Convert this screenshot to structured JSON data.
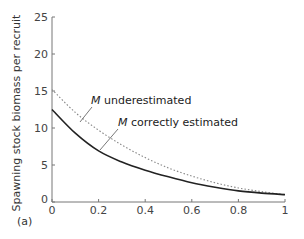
{
  "chart_data": {
    "type": "line",
    "title": "",
    "panel_label": "(a)",
    "xlabel": "",
    "ylabel": "Spawning stock biomass per recruit",
    "xlim": [
      0,
      1
    ],
    "ylim": [
      0,
      25
    ],
    "x_ticks": [
      "0",
      "0.2",
      "0.4",
      "0.6",
      "0.8",
      "1"
    ],
    "y_ticks": [
      "0",
      "5",
      "10",
      "15",
      "20",
      "25"
    ],
    "grid": false,
    "legend": "inline annotations",
    "x": [
      0,
      0.1,
      0.2,
      0.3,
      0.4,
      0.5,
      0.6,
      0.7,
      0.8,
      0.9,
      1.0
    ],
    "series": [
      {
        "name": "M underestimated",
        "style": "dotted",
        "color": "#888888",
        "values": [
          15.2,
          12.1,
          9.7,
          7.7,
          6.0,
          4.6,
          3.5,
          2.6,
          1.9,
          1.4,
          1.0
        ]
      },
      {
        "name": "M correctly estimated",
        "style": "solid",
        "color": "#222222",
        "values": [
          12.5,
          9.3,
          6.9,
          5.4,
          4.3,
          3.4,
          2.6,
          2.0,
          1.5,
          1.2,
          1.0
        ]
      }
    ],
    "annotations": [
      {
        "prefix": "M",
        "text": " underestimated",
        "target_series": "M underestimated"
      },
      {
        "prefix": "M",
        "text": " correctly estimated",
        "target_series": "M correctly estimated"
      }
    ]
  }
}
